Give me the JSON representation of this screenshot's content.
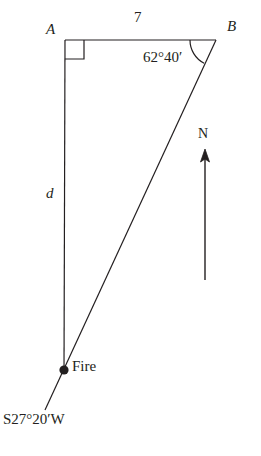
{
  "figure": {
    "type": "geometry-diagram",
    "width": 261,
    "height": 456,
    "background_color": "#ffffff",
    "stroke_color": "#231f20"
  },
  "labels": {
    "vertex_a": "A",
    "vertex_b": "B",
    "side_ab": "7",
    "side_d": "d",
    "angle_b": "62°40′",
    "north": "N",
    "fire": "Fire",
    "bearing": "S27°20′W"
  },
  "geometry": {
    "points": {
      "A": {
        "x": 65,
        "y": 40
      },
      "B": {
        "x": 216,
        "y": 40
      },
      "fire": {
        "x": 64,
        "y": 370
      },
      "ray_end": {
        "x": 45,
        "y": 410
      }
    },
    "right_angle_marker": {
      "at": "A",
      "size": 19
    },
    "angle_arc": {
      "at": "B",
      "value": "62°40′",
      "radius": 26
    },
    "north_arrow": {
      "x": 205,
      "tip_y": 152,
      "tail_y": 280
    },
    "fire_marker": {
      "x": 64,
      "y": 370,
      "radius": 4.5
    }
  }
}
